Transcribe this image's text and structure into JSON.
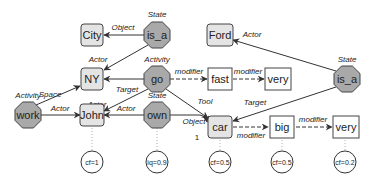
{
  "diagram": {
    "colors": {
      "concept_fill": "#e4e4e4",
      "relation_fill": "#a9a9a9",
      "stroke": "#444444",
      "edge": "#333333",
      "plain_fill": "#ffffff"
    },
    "nodes": {
      "city": {
        "label": "City",
        "type": "concept"
      },
      "is_a_top": {
        "label": "is_a",
        "type": "relation",
        "role": "State"
      },
      "ny": {
        "label": "NY",
        "type": "concept"
      },
      "go": {
        "label": "go",
        "type": "relation",
        "role": "Activity"
      },
      "fast": {
        "label": "fast",
        "type": "modifier"
      },
      "very_top": {
        "label": "very",
        "type": "modifier"
      },
      "ford": {
        "label": "Ford",
        "type": "concept"
      },
      "is_a_right": {
        "label": "is_a",
        "type": "relation",
        "role": "State"
      },
      "work": {
        "label": "work",
        "type": "relation",
        "role": "Activity"
      },
      "john": {
        "label": "John",
        "type": "concept"
      },
      "own": {
        "label": "own",
        "type": "relation",
        "role": "State"
      },
      "car": {
        "label": "car",
        "type": "concept"
      },
      "big": {
        "label": "big",
        "type": "modifier"
      },
      "very_bottom": {
        "label": "very",
        "type": "modifier"
      }
    },
    "role_labels": {
      "is_a_top": "State",
      "go": "Activity",
      "is_a_right": "State",
      "work": "Activity",
      "own": "State"
    },
    "edges": [
      {
        "from": "is_a_top",
        "to": "city",
        "label": "Object",
        "style": "solid"
      },
      {
        "from": "is_a_top",
        "to": "ny",
        "label": "Actor",
        "style": "solid"
      },
      {
        "from": "go",
        "to": "ny",
        "label": "Target",
        "style": "solid"
      },
      {
        "from": "go",
        "to": "john",
        "label": "Actor",
        "style": "solid"
      },
      {
        "from": "go",
        "to": "fast",
        "label": "modifier",
        "style": "dashed"
      },
      {
        "from": "fast",
        "to": "very_top",
        "label": "modifier",
        "style": "dashed"
      },
      {
        "from": "go",
        "to": "car",
        "label": "Tool",
        "style": "solid"
      },
      {
        "from": "work",
        "to": "ny",
        "label": "Space",
        "style": "solid"
      },
      {
        "from": "work",
        "to": "john",
        "label": "Actor",
        "style": "solid"
      },
      {
        "from": "own",
        "to": "john",
        "label": "Actor",
        "style": "solid"
      },
      {
        "from": "own",
        "to": "car",
        "label": "Object",
        "style": "solid",
        "cardinality": "1"
      },
      {
        "from": "is_a_right",
        "to": "ford",
        "label": "Actor",
        "style": "solid"
      },
      {
        "from": "is_a_right",
        "to": "car",
        "label": "Target",
        "style": "solid"
      },
      {
        "from": "car",
        "to": "big",
        "label": "modifier",
        "style": "dashed"
      },
      {
        "from": "big",
        "to": "very_bottom",
        "label": "modifier",
        "style": "dashed"
      }
    ],
    "edge_labels": {
      "object_city": "Object",
      "actor_ny": "Actor",
      "target_ny": "Target",
      "actor_john_go": "Actor",
      "modifier_fast": "modifier",
      "modifier_very_top": "modifier",
      "tool_car": "Tool",
      "space_ny": "Space",
      "actor_john_work": "Actor",
      "actor_john_own": "Actor",
      "object_car": "Object",
      "cardinality_car": "1",
      "actor_ford": "Actor",
      "target_car": "Target",
      "modifier_big": "modifier",
      "modifier_very_bottom": "modifier"
    },
    "annotations": {
      "john": "cf=1",
      "own": "iq=0.9",
      "car": "cf=0.5",
      "big": "cf=0.5",
      "very_bottom": "cf=0.2"
    }
  }
}
